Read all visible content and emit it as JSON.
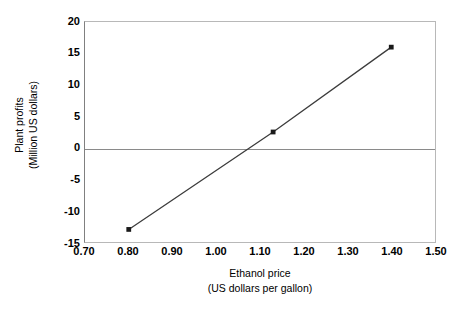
{
  "chart_data": {
    "type": "line",
    "title": "",
    "xlabel": "Ethanol price",
    "xlabel_units": "(US dollars per gallon)",
    "ylabel": "Plant profits",
    "ylabel_units": "(Million US dollars)",
    "xlim": [
      0.7,
      1.5
    ],
    "ylim": [
      -15,
      20
    ],
    "xticks": [
      "0.70",
      "0.80",
      "0.90",
      "1.00",
      "1.10",
      "1.20",
      "1.30",
      "1.40",
      "1.50"
    ],
    "xtick_values": [
      0.7,
      0.8,
      0.9,
      1.0,
      1.1,
      1.2,
      1.3,
      1.4,
      1.5
    ],
    "yticks": [
      "20",
      "15",
      "10",
      "5",
      "0",
      "-5",
      "-10",
      "-15"
    ],
    "ytick_values": [
      20,
      15,
      10,
      5,
      0,
      -5,
      -10,
      -15
    ],
    "grid": false,
    "legend": false,
    "zero_line": true,
    "series": [
      {
        "name": "Plant profits",
        "x": [
          0.8,
          1.13,
          1.4
        ],
        "values": [
          -13.0,
          2.5,
          16.0
        ],
        "marker": "square",
        "color": "#3c3c3c"
      }
    ],
    "breakeven_price": 1.06,
    "line_color": "#3c3c3c",
    "marker_color": "#1a1a1a",
    "axis_color": "#8a8a8a",
    "background": "#ffffff"
  }
}
